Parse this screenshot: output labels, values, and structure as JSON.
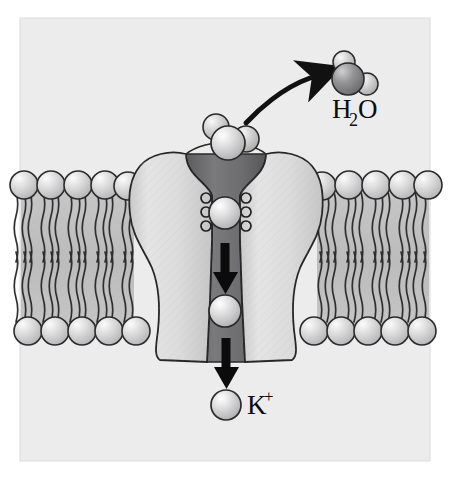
{
  "figure": {
    "panel": {
      "x": 20,
      "y": 18,
      "width": 410,
      "height": 443,
      "background_color": "#ececed",
      "border_color": "#d9d9da"
    },
    "page_background_color": "#ffffff"
  },
  "labels": {
    "water": {
      "text_main": "H",
      "text_sub": "2",
      "text_tail": "O",
      "full": "H2O",
      "x": 332,
      "y": 118,
      "font_size": 27
    },
    "potassium": {
      "text_main": "K",
      "text_sup": "+",
      "full": "K+",
      "x": 247,
      "y": 414,
      "font_size": 27
    }
  },
  "membrane": {
    "name": "phospholipid-bilayer",
    "left_span": {
      "x_start": 21,
      "x_end": 133
    },
    "right_span": {
      "x_start": 317,
      "x_end": 429
    },
    "upper_head_center_y": 185,
    "lower_head_center_y": 331,
    "head_radius": 14,
    "head_fill": "#cfcfd0",
    "head_highlight": "#f4f4f5",
    "head_stroke": "#2b2b2b",
    "tail_color": "#2f2f2f",
    "interior_fill": "#bfbfc0",
    "head_spacing": 27,
    "tail_top_y": 196,
    "tail_mid_y": 262,
    "tail_bottom_y": 320
  },
  "channel_protein": {
    "name": "potassium-channel-protein",
    "fill": "#d6d6d7",
    "fill_light": "#e6e6e7",
    "stroke": "#262626",
    "center_x": 225,
    "top_y": 152,
    "bottom_y": 362,
    "outer_left_x": 128,
    "outer_right_x": 322,
    "waist_left_x": 172,
    "waist_right_x": 278
  },
  "pore": {
    "name": "channel-pore",
    "fill_dark": "#6e6e70",
    "fill_darker": "#5a5a5c",
    "top_width": 78,
    "filter_width": 26,
    "lower_width": 34,
    "top_y": 152,
    "bottom_y": 362
  },
  "selectivity_filter": {
    "name": "selectivity-filter-carbonyls",
    "loop_count_per_side": 3,
    "loop_radius": 5,
    "left_x": 206,
    "right_x": 244,
    "y_positions": [
      198,
      212,
      226
    ],
    "stroke": "#1f1f1f",
    "fill": "none"
  },
  "ions": [
    {
      "name": "potassium-ion-in-filter",
      "cx": 225,
      "cy": 213,
      "r": 16,
      "label": "K+ ion in selectivity filter"
    },
    {
      "name": "potassium-ion-in-pore",
      "cx": 225,
      "cy": 311,
      "r": 16,
      "label": "K+ ion descending pore"
    },
    {
      "name": "potassium-ion-released",
      "cx": 226,
      "cy": 405,
      "r": 15,
      "label": "released K+ ion"
    }
  ],
  "ion_style": {
    "fill": "#d0d0d1",
    "highlight": "#f6f6f7",
    "stroke": "#2a2a2a"
  },
  "hydrated_ion": {
    "name": "hydrated-potassium-ion",
    "core": {
      "cx": 228,
      "cy": 143,
      "r": 17
    },
    "waters": [
      {
        "cx": 217,
        "cy": 127,
        "r": 13,
        "tone": "light"
      },
      {
        "cx": 245,
        "cy": 139,
        "r": 13,
        "tone": "light"
      }
    ],
    "label": "hydrated K+ at channel mouth"
  },
  "water_molecule": {
    "name": "water-molecule",
    "oxygen": {
      "cx": 348,
      "cy": 79,
      "r": 16,
      "fill": "#8d8d8f"
    },
    "hydrogens": [
      {
        "cx": 344,
        "cy": 62,
        "r": 11,
        "fill": "#c9c9ca"
      },
      {
        "cx": 367,
        "cy": 84,
        "r": 11,
        "fill": "#c9c9ca"
      }
    ]
  },
  "arrows": {
    "curved_water_release": {
      "name": "curved-arrow-water-release",
      "path": "M 246,123 C 258,110 282,88 312,78",
      "color": "#111111",
      "stroke_width": 5,
      "head_at": [
        327,
        74
      ],
      "head_angle": -20
    },
    "down_upper": {
      "name": "down-arrow-upper-pore",
      "x": 225,
      "y_start": 243,
      "y_end": 288,
      "color": "#0b0b0b",
      "shaft_width": 9,
      "head_width": 24,
      "head_height": 22
    },
    "down_lower": {
      "name": "down-arrow-lower-exit",
      "x": 226,
      "y_start": 338,
      "y_end": 383,
      "color": "#0b0b0b",
      "shaft_width": 9,
      "head_width": 24,
      "head_height": 22
    }
  }
}
